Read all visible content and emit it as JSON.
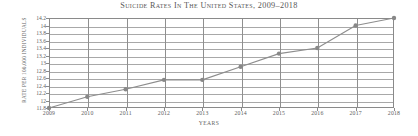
{
  "chart_data": {
    "type": "line",
    "title": "Suicide rates in the United States, 2009–2018",
    "xlabel": "Years",
    "ylabel": "Rate per 100,000 individuals",
    "categories": [
      "2009",
      "2010",
      "2011",
      "2012",
      "2013",
      "2014",
      "2015",
      "2016",
      "2017",
      "2018"
    ],
    "x": [
      2009,
      2010,
      2011,
      2012,
      2013,
      2014,
      2015,
      2016,
      2017,
      2018
    ],
    "values": [
      11.8,
      12.1,
      12.3,
      12.55,
      12.55,
      12.9,
      13.25,
      13.4,
      14.0,
      14.2
    ],
    "series": [
      {
        "name": "Suicide rate",
        "values": [
          11.8,
          12.1,
          12.3,
          12.55,
          12.55,
          12.9,
          13.25,
          13.4,
          14.0,
          14.2
        ]
      }
    ],
    "ylim": [
      11.8,
      14.2
    ],
    "xlim": [
      2009,
      2018
    ],
    "yticks": [
      11.8,
      12,
      12.2,
      12.4,
      12.6,
      12.8,
      13,
      13.2,
      13.4,
      13.6,
      13.8,
      14,
      14.2
    ],
    "ytick_labels": [
      "11.8",
      "12",
      "12.2",
      "12.4",
      "12.6",
      "12.8",
      "13",
      "13.2",
      "13.4",
      "13.6",
      "13.8",
      "14",
      "14.2"
    ],
    "grid": true,
    "grid_axes": "both",
    "legend": false,
    "legend_position": "none",
    "marker": "circle",
    "line_color": "#8d8d8d",
    "marker_color": "#888888",
    "grid_color": "#a8a8a8",
    "axis_color": "#8a8a8a",
    "text_color": "#5a5a5a",
    "background_color": "#ffffff"
  }
}
